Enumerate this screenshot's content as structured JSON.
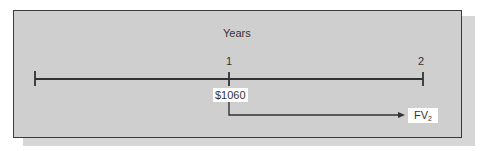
{
  "diagram": {
    "title": "Years",
    "timeline": {
      "points": [
        {
          "label": ""
        },
        {
          "label": "1"
        },
        {
          "label": "2"
        }
      ]
    },
    "cash_flow": {
      "value": "$1060",
      "at_period": "1"
    },
    "result": {
      "main": "FV",
      "subscript": "2",
      "at_period": "2"
    },
    "colors": {
      "panel": "#cfcfcf",
      "line": "#333333",
      "label_bg": "#ffffff"
    }
  }
}
